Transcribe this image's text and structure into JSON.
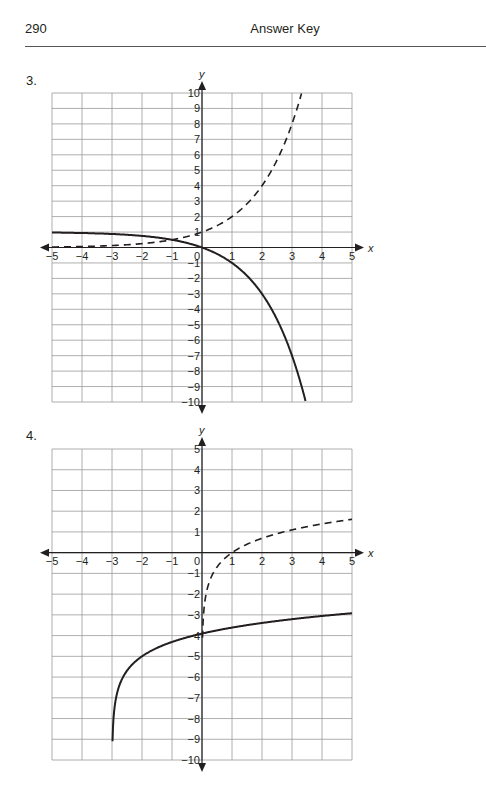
{
  "header": {
    "page_number": "290",
    "title": "Answer Key"
  },
  "chart_data": [
    {
      "label": "3.",
      "type": "line",
      "xlabel": "x",
      "ylabel": "y",
      "xlim": [
        -5,
        5
      ],
      "ylim": [
        -10,
        10
      ],
      "x_ticks": [
        -5,
        -4,
        -3,
        -2,
        -1,
        0,
        1,
        2,
        3,
        4,
        5
      ],
      "y_ticks": [
        -10,
        -9,
        -8,
        -7,
        -6,
        -5,
        -4,
        -3,
        -2,
        -1,
        1,
        2,
        3,
        4,
        5,
        6,
        7,
        8,
        9,
        10
      ],
      "grid": true,
      "series": [
        {
          "name": "dashed",
          "style": "dashed",
          "function": "y = 2^x",
          "x": [
            -5,
            -4,
            -3,
            -2,
            -1,
            0,
            1,
            2,
            3,
            3.32
          ],
          "y": [
            0.03,
            0.06,
            0.13,
            0.25,
            0.5,
            1,
            2,
            4,
            8,
            10
          ]
        },
        {
          "name": "solid",
          "style": "solid",
          "function": "y = 1 - 2^x",
          "x": [
            -5,
            -4,
            -3,
            -2,
            -1,
            0,
            1,
            2,
            3,
            3.46
          ],
          "y": [
            0.97,
            0.94,
            0.88,
            0.75,
            0.5,
            0,
            -1,
            -3,
            -7,
            -10
          ]
        }
      ]
    },
    {
      "label": "4.",
      "type": "line",
      "xlabel": "x",
      "ylabel": "y",
      "xlim": [
        -5,
        5
      ],
      "ylim": [
        -10,
        5
      ],
      "x_ticks": [
        -5,
        -4,
        -3,
        -2,
        -1,
        0,
        1,
        2,
        3,
        4,
        5
      ],
      "y_ticks": [
        -10,
        -9,
        -8,
        -7,
        -6,
        -5,
        -4,
        -3,
        -2,
        -1,
        1,
        2,
        3,
        4,
        5
      ],
      "grid": true,
      "series": [
        {
          "name": "dashed",
          "style": "dashed",
          "function": "y = ln(x)",
          "x": [
            0.05,
            0.25,
            0.5,
            1,
            2,
            3,
            4,
            5
          ],
          "y": [
            -3,
            -1.39,
            -0.69,
            0,
            0.69,
            1.1,
            1.39,
            1.61
          ]
        },
        {
          "name": "solid",
          "style": "solid",
          "function": "y = ln(x+3) - 5",
          "x": [
            -2.98,
            -2.9,
            -2.5,
            -2,
            -1,
            0,
            1,
            2,
            3,
            4,
            5
          ],
          "y": [
            -9,
            -7.3,
            -5.69,
            -5,
            -4.31,
            -3.9,
            -3.61,
            -3.39,
            -3.21,
            -3.05,
            -2.92
          ]
        }
      ]
    }
  ]
}
